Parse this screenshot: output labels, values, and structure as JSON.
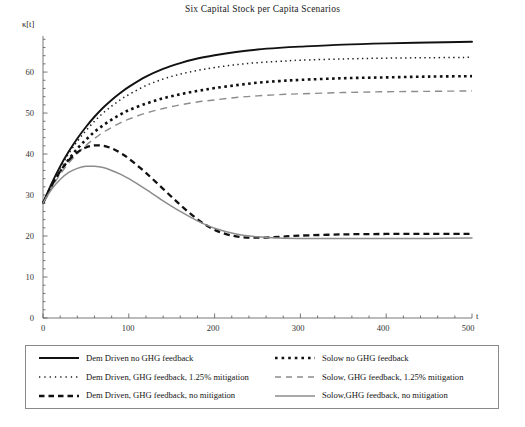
{
  "chart": {
    "title": "Six Capital Stock per Capita Scenarios",
    "ylabel": "κ[t]",
    "xlabel": "t"
  },
  "axes": {
    "yticks": [
      "0",
      "10",
      "20",
      "30",
      "40",
      "50",
      "60"
    ],
    "xticks": [
      "0",
      "100",
      "200",
      "300",
      "400",
      "500"
    ]
  },
  "legend": {
    "items": [
      {
        "label": "Dem Driven no GHG feedback",
        "style": "solid-black"
      },
      {
        "label": "Solow no GHG feedback",
        "style": "dotted-bold-black"
      },
      {
        "label": "Dem Driven, GHG feedback, 1.25% mitigation",
        "style": "dotted-fine-black"
      },
      {
        "label": "Solow, GHG feedback, 1.25% mitigation",
        "style": "dashed-long-gray"
      },
      {
        "label": "Dem Driven, GHG feedback, no mitigation",
        "style": "dashed-black"
      },
      {
        "label": "Solow,GHG feedback, no mitigation",
        "style": "solid-gray"
      }
    ]
  },
  "chart_data": {
    "type": "line",
    "title": "Six Capital Stock per Capita Scenarios",
    "xlabel": "t",
    "ylabel": "κ[t]",
    "xlim": [
      0,
      500
    ],
    "ylim": [
      0,
      68
    ],
    "grid": false,
    "legend_position": "bottom",
    "x": [
      0,
      10,
      20,
      30,
      40,
      50,
      60,
      70,
      80,
      90,
      100,
      120,
      140,
      160,
      180,
      200,
      225,
      250,
      275,
      300,
      350,
      400,
      450,
      500
    ],
    "series": [
      {
        "name": "Dem Driven no GHG feedback",
        "style": "solid-black",
        "color": "#111111",
        "values": [
          28.0,
          32.8,
          37.0,
          40.6,
          43.8,
          46.6,
          49.1,
          51.3,
          53.2,
          54.9,
          56.4,
          58.9,
          60.8,
          62.2,
          63.3,
          64.1,
          64.9,
          65.5,
          65.9,
          66.2,
          66.7,
          67.0,
          67.2,
          67.4
        ]
      },
      {
        "name": "Dem Driven, GHG feedback, 1.25% mitigation",
        "style": "dotted-fine-black",
        "color": "#1b1b1b",
        "values": [
          28.0,
          32.6,
          36.6,
          40.1,
          43.1,
          45.7,
          48.0,
          50.0,
          51.7,
          53.2,
          54.5,
          56.7,
          58.3,
          59.5,
          60.4,
          61.1,
          61.8,
          62.3,
          62.6,
          62.9,
          63.2,
          63.4,
          63.5,
          63.6
        ]
      },
      {
        "name": "Solow no GHG feedback",
        "style": "dotted-bold-black",
        "color": "#111111",
        "values": [
          28.0,
          32.2,
          35.7,
          38.7,
          41.3,
          43.5,
          45.4,
          47.0,
          48.4,
          49.6,
          50.7,
          52.3,
          53.6,
          54.6,
          55.4,
          56.1,
          56.8,
          57.4,
          57.8,
          58.1,
          58.5,
          58.7,
          58.9,
          59.0
        ]
      },
      {
        "name": "Solow, GHG feedback, 1.25% mitigation",
        "style": "dashed-long-gray",
        "color": "#8c8c8c",
        "values": [
          28.0,
          31.8,
          35.0,
          37.8,
          40.1,
          42.1,
          43.8,
          45.3,
          46.5,
          47.6,
          48.5,
          50.0,
          51.1,
          52.0,
          52.7,
          53.2,
          53.8,
          54.2,
          54.5,
          54.7,
          55.0,
          55.2,
          55.3,
          55.4
        ]
      },
      {
        "name": "Dem Driven, GHG feedback, no mitigation",
        "style": "dashed-black",
        "color": "#111111",
        "values": [
          28.0,
          32.2,
          35.8,
          38.5,
          40.4,
          41.6,
          42.1,
          42.0,
          41.4,
          40.3,
          38.9,
          35.4,
          31.5,
          27.6,
          24.1,
          21.5,
          19.9,
          19.6,
          19.8,
          20.1,
          20.4,
          20.5,
          20.5,
          20.5
        ]
      },
      {
        "name": "Solow,GHG feedback, no mitigation",
        "style": "solid-gray",
        "color": "#8c8c8c",
        "values": [
          28.0,
          31.4,
          33.8,
          35.5,
          36.5,
          37.0,
          37.0,
          36.7,
          36.0,
          35.1,
          34.0,
          31.4,
          28.6,
          26.0,
          23.7,
          21.9,
          20.5,
          19.8,
          19.5,
          19.4,
          19.4,
          19.4,
          19.4,
          19.5
        ]
      }
    ]
  }
}
